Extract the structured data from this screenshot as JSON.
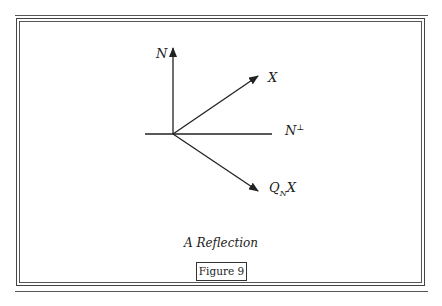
{
  "figure": {
    "caption": "A Reflection",
    "label": "Figure 9"
  },
  "diagram": {
    "labels": {
      "normal": "N",
      "vector": "X",
      "hyperplane_base": "N",
      "hyperplane_sup": "⊥",
      "reflection_main": "Q",
      "reflection_sub": "N",
      "reflection_tail": "X"
    },
    "colors": {
      "stroke": "#222222",
      "border": "#555555"
    }
  }
}
